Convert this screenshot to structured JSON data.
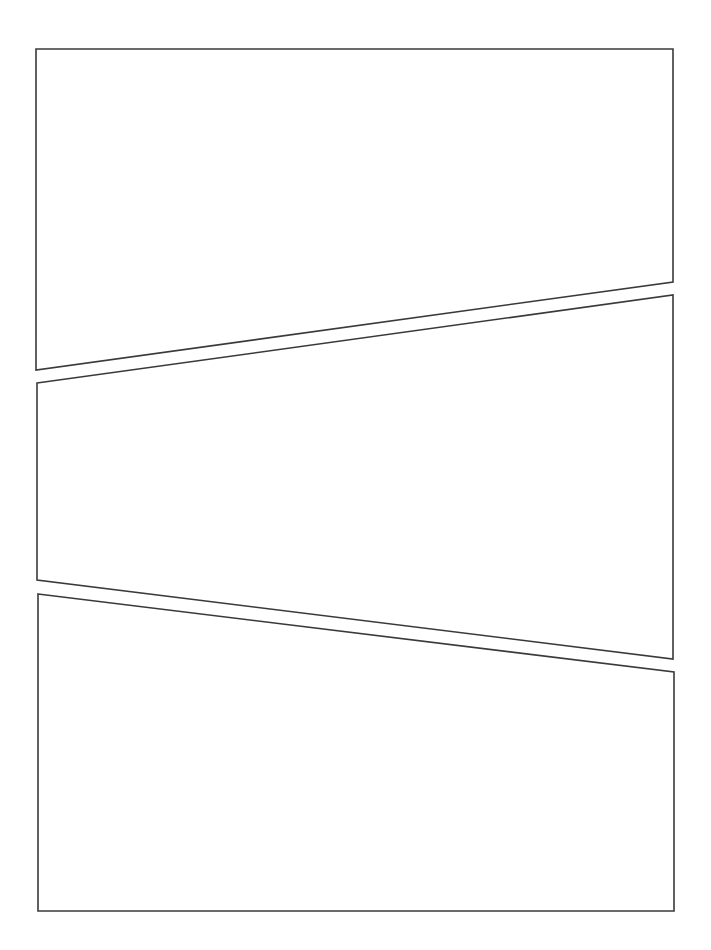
{
  "page": {
    "width": 711,
    "height": 950,
    "background": "#ffffff",
    "border_color": "#3a3a3a"
  },
  "panels": [
    {
      "id": "panel-1",
      "points": [
        [
          36,
          49
        ],
        [
          673,
          49
        ],
        [
          673,
          282
        ],
        [
          36,
          370
        ]
      ]
    },
    {
      "id": "panel-2",
      "points": [
        [
          37,
          383
        ],
        [
          673,
          295
        ],
        [
          673,
          659
        ],
        [
          37,
          580
        ]
      ]
    },
    {
      "id": "panel-3",
      "points": [
        [
          38,
          594
        ],
        [
          674,
          672
        ],
        [
          674,
          911
        ],
        [
          38,
          911
        ]
      ]
    }
  ]
}
